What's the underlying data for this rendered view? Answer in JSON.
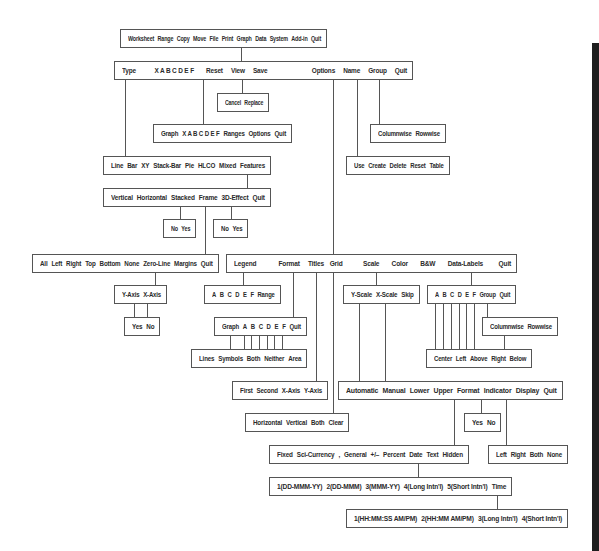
{
  "diagram": {
    "colors": {
      "line": "#555555",
      "text": "#2a2a2a",
      "background": "#ffffff",
      "edge_bar": "#1e1e1e"
    },
    "boxes": [
      {
        "id": "main_menu",
        "x": 120,
        "y": 29,
        "w": 207,
        "h": 19,
        "items": [
          "Worksheet",
          "Range",
          "Copy",
          "Move",
          "File",
          "Print",
          "Graph",
          "Data",
          "System",
          "Add-in",
          "Quit"
        ]
      },
      {
        "id": "graph_menu",
        "x": 114,
        "y": 61,
        "w": 299,
        "h": 19,
        "items": [
          "Type",
          "X A B C D E F",
          "Reset",
          "View",
          "Save",
          "Options",
          "Name",
          "Group",
          "Quit"
        ],
        "gaps": [
          0,
          18,
          10,
          5,
          5,
          50,
          5,
          5,
          5
        ]
      },
      {
        "id": "save_menu",
        "x": 217,
        "y": 93,
        "w": 52,
        "h": 19,
        "items": [
          "Cancel",
          "Replace"
        ]
      },
      {
        "id": "reset_menu",
        "x": 153,
        "y": 124,
        "w": 139,
        "h": 19,
        "items": [
          "Graph",
          "X A B C D E F",
          "Ranges",
          "Options",
          "Quit"
        ]
      },
      {
        "id": "group_menu",
        "x": 370,
        "y": 124,
        "w": 76,
        "h": 19,
        "items": [
          "Columnwise",
          "Rowwise"
        ]
      },
      {
        "id": "type_menu",
        "x": 103,
        "y": 156,
        "w": 168,
        "h": 19,
        "items": [
          "Line",
          "Bar",
          "XY",
          "Stack-Bar",
          "Pie",
          "HLCO",
          "Mixed",
          "Features"
        ]
      },
      {
        "id": "name_menu",
        "x": 346,
        "y": 156,
        "w": 104,
        "h": 19,
        "items": [
          "Use",
          "Create",
          "Delete",
          "Reset",
          "Table"
        ]
      },
      {
        "id": "features_menu",
        "x": 103,
        "y": 188,
        "w": 168,
        "h": 19,
        "items": [
          "Vertical",
          "Horizontal",
          "Stacked",
          "Frame",
          "3D-Effect",
          "Quit"
        ]
      },
      {
        "id": "stacked_yesno",
        "x": 163,
        "y": 219,
        "w": 33,
        "h": 19,
        "items": [
          "No",
          "Yes"
        ]
      },
      {
        "id": "effect_yesno",
        "x": 213,
        "y": 219,
        "w": 35,
        "h": 19,
        "items": [
          "No",
          "Yes"
        ]
      },
      {
        "id": "frame_menu",
        "x": 32,
        "y": 254,
        "w": 187,
        "h": 19,
        "items": [
          "All",
          "Left",
          "Right",
          "Top",
          "Bottom",
          "None",
          "Zero-Line",
          "Margins",
          "Quit"
        ]
      },
      {
        "id": "options_menu",
        "x": 226,
        "y": 254,
        "w": 291,
        "h": 19,
        "items": [
          "Legend",
          "Format",
          "Titles",
          "Grid",
          "Scale",
          "Color",
          "B&W",
          "Data-Labels",
          "Quit"
        ],
        "gaps": [
          0,
          22,
          5,
          2,
          20,
          10,
          10,
          10,
          14
        ]
      },
      {
        "id": "margins_axis",
        "x": 114,
        "y": 285,
        "w": 53,
        "h": 19,
        "items": [
          "Y-Axis",
          "X-Axis"
        ]
      },
      {
        "id": "legend_menu",
        "x": 204,
        "y": 285,
        "w": 77,
        "h": 19,
        "items": [
          "A",
          "B",
          "C",
          "D",
          "E",
          "F",
          "Range"
        ]
      },
      {
        "id": "scale_menu",
        "x": 343,
        "y": 285,
        "w": 77,
        "h": 19,
        "items": [
          "Y-Scale",
          "X-Scale",
          "Skip"
        ]
      },
      {
        "id": "datalabels_menu",
        "x": 427,
        "y": 285,
        "w": 89,
        "h": 19,
        "items": [
          "A",
          "B",
          "C",
          "D",
          "E",
          "F",
          "Group",
          "Quit"
        ]
      },
      {
        "id": "axis_yesno",
        "x": 124,
        "y": 317,
        "w": 36,
        "h": 19,
        "items": [
          "Yes",
          "No"
        ]
      },
      {
        "id": "format_menu",
        "x": 214,
        "y": 317,
        "w": 93,
        "h": 19,
        "items": [
          "Graph",
          "A",
          "B",
          "C",
          "D",
          "E",
          "F",
          "Quit"
        ]
      },
      {
        "id": "datalabels_group",
        "x": 482,
        "y": 317,
        "w": 76,
        "h": 19,
        "items": [
          "Columnwise",
          "Rowwise"
        ]
      },
      {
        "id": "format_style",
        "x": 191,
        "y": 349,
        "w": 116,
        "h": 19,
        "items": [
          "Lines",
          "Symbols",
          "Both",
          "Neither",
          "Area"
        ]
      },
      {
        "id": "label_position",
        "x": 426,
        "y": 349,
        "w": 106,
        "h": 19,
        "items": [
          "Center",
          "Left",
          "Above",
          "Right",
          "Below"
        ]
      },
      {
        "id": "titles_menu",
        "x": 232,
        "y": 381,
        "w": 96,
        "h": 19,
        "items": [
          "First",
          "Second",
          "X-Axis",
          "Y-Axis"
        ]
      },
      {
        "id": "scale_options",
        "x": 338,
        "y": 381,
        "w": 225,
        "h": 19,
        "items": [
          "Automatic",
          "Manual",
          "Lower",
          "Upper",
          "Format",
          "Indicator",
          "Display",
          "Quit"
        ]
      },
      {
        "id": "grid_menu",
        "x": 245,
        "y": 413,
        "w": 104,
        "h": 19,
        "items": [
          "Horizontal",
          "Vertical",
          "Both",
          "Clear"
        ]
      },
      {
        "id": "indicator_yesno",
        "x": 464,
        "y": 413,
        "w": 37,
        "h": 19,
        "items": [
          "Yes",
          "No"
        ]
      },
      {
        "id": "number_format",
        "x": 269,
        "y": 445,
        "w": 200,
        "h": 19,
        "items": [
          "Fixed",
          "Sci-Currency",
          ",",
          "General",
          "+/–",
          "Percent",
          "Date",
          "Text",
          "Hidden"
        ]
      },
      {
        "id": "display_menu",
        "x": 488,
        "y": 445,
        "w": 80,
        "h": 19,
        "items": [
          "Left",
          "Right",
          "Both",
          "None"
        ]
      },
      {
        "id": "date_format",
        "x": 269,
        "y": 477,
        "w": 243,
        "h": 19,
        "items": [
          "1(DD-MMM-YY)",
          "2(DD-MMM)",
          "3(MMM-YY)",
          "4(Long Intn'l)",
          "5(Short Intn'l)",
          "Time"
        ]
      },
      {
        "id": "time_format",
        "x": 346,
        "y": 509,
        "w": 222,
        "h": 19,
        "items": [
          "1(HH:MM:SS AM/PM)",
          "2(HH:MM AM/PM)",
          "3(Long Intn'l)",
          "4(Short Intn'l)"
        ]
      }
    ],
    "edges": [
      {
        "from": "main_menu",
        "item": "Graph",
        "to": "graph_menu",
        "points": [
          [
            241,
            48
          ],
          [
            241,
            61
          ]
        ]
      },
      {
        "from": "graph_menu",
        "item": "Type",
        "to": "type_menu",
        "points": [
          [
            125,
            80
          ],
          [
            125,
            156
          ]
        ]
      },
      {
        "from": "graph_menu",
        "item": "Reset",
        "to": "reset_menu",
        "points": [
          [
            203,
            80
          ],
          [
            203,
            124
          ]
        ]
      },
      {
        "from": "graph_menu",
        "item": "Save",
        "to": "save_menu",
        "points": [
          [
            242,
            80
          ],
          [
            242,
            93
          ]
        ]
      },
      {
        "from": "graph_menu",
        "item": "Options",
        "to": "options_menu",
        "points": [
          [
            333,
            80
          ],
          [
            333,
            254
          ]
        ]
      },
      {
        "from": "graph_menu",
        "item": "Name",
        "to": "name_menu",
        "points": [
          [
            357,
            80
          ],
          [
            357,
            156
          ]
        ]
      },
      {
        "from": "graph_menu",
        "item": "Group",
        "to": "group_menu",
        "points": [
          [
            379,
            80
          ],
          [
            379,
            124
          ]
        ]
      },
      {
        "from": "type_menu",
        "item": "Features",
        "to": "features_menu",
        "points": [
          [
            247,
            175
          ],
          [
            247,
            188
          ]
        ]
      },
      {
        "from": "features_menu",
        "item": "Vertical",
        "to": "stacked_yesno",
        "points": [
          [
            180,
            207
          ],
          [
            180,
            219
          ]
        ]
      },
      {
        "from": "features_menu",
        "item": "Frame",
        "to": "frame_menu",
        "points": [
          [
            205,
            207
          ],
          [
            205,
            254
          ]
        ]
      },
      {
        "from": "features_menu",
        "item": "3D-Effect",
        "to": "effect_yesno",
        "points": [
          [
            231,
            207
          ],
          [
            231,
            219
          ]
        ]
      },
      {
        "from": "frame_menu",
        "item": "Margins",
        "to": "margins_axis",
        "points": [
          [
            155,
            273
          ],
          [
            155,
            285
          ]
        ]
      },
      {
        "from": "margins_axis",
        "item": "Y-Axis",
        "to": "axis_yesno",
        "points": [
          [
            134,
            304
          ],
          [
            134,
            317
          ]
        ]
      },
      {
        "from": "margins_axis",
        "item": "X-Axis",
        "to": "axis_yesno",
        "points": [
          [
            147,
            304
          ],
          [
            147,
            317
          ]
        ]
      },
      {
        "from": "options_menu",
        "item": "Legend",
        "to": "legend_menu",
        "points": [
          [
            243,
            273
          ],
          [
            243,
            285
          ]
        ]
      },
      {
        "from": "options_menu",
        "item": "Format",
        "to": "format_menu",
        "points": [
          [
            293,
            273
          ],
          [
            293,
            317
          ]
        ]
      },
      {
        "from": "options_menu",
        "item": "Titles",
        "to": "titles_menu",
        "points": [
          [
            316,
            273
          ],
          [
            316,
            381
          ]
        ]
      },
      {
        "from": "options_menu",
        "item": "Grid",
        "to": "grid_menu",
        "points": [
          [
            333,
            273
          ],
          [
            333,
            413
          ]
        ]
      },
      {
        "from": "options_menu",
        "item": "Scale",
        "to": "scale_menu",
        "points": [
          [
            376,
            273
          ],
          [
            376,
            285
          ]
        ]
      },
      {
        "from": "options_menu",
        "item": "Data-Labels",
        "to": "datalabels_menu",
        "points": [
          [
            471,
            273
          ],
          [
            471,
            285
          ]
        ]
      },
      {
        "from": "scale_menu",
        "item": "Y-Scale",
        "to": "scale_options",
        "points": [
          [
            359,
            304
          ],
          [
            359,
            381
          ]
        ]
      },
      {
        "from": "scale_menu",
        "item": "X-Scale",
        "to": "scale_options",
        "points": [
          [
            385,
            304
          ],
          [
            385,
            381
          ]
        ]
      },
      {
        "from": "format_menu",
        "item": "Graph",
        "to": "format_style",
        "points": [
          [
            230,
            336
          ],
          [
            230,
            349
          ]
        ]
      },
      {
        "from": "format_menu",
        "items": [
          "A",
          "B",
          "C",
          "D",
          "E",
          "F"
        ],
        "to": "format_style",
        "xs": [
          244,
          251,
          259,
          267,
          274,
          282
        ],
        "y1": 336,
        "y2": 349
      },
      {
        "from": "datalabels_menu",
        "items": [
          "A",
          "B",
          "C",
          "D",
          "E",
          "F"
        ],
        "to": "label_position",
        "xs": [
          435,
          443,
          451,
          459,
          466,
          474
        ],
        "y1": 304,
        "y2": 349
      },
      {
        "from": "datalabels_menu",
        "item": "Group",
        "to": "datalabels_group",
        "points": [
          [
            487,
            304
          ],
          [
            487,
            317
          ]
        ]
      },
      {
        "from": "datalabels_group",
        "to": "label_position",
        "points": [
          [
            504,
            336
          ],
          [
            504,
            349
          ]
        ]
      },
      {
        "from": "scale_options",
        "item": "Format",
        "to": "number_format",
        "points": [
          [
            454,
            400
          ],
          [
            454,
            445
          ]
        ]
      },
      {
        "from": "scale_options",
        "item": "Indicator",
        "to": "indicator_yesno",
        "points": [
          [
            481,
            400
          ],
          [
            481,
            413
          ]
        ]
      },
      {
        "from": "scale_options",
        "item": "Display",
        "to": "display_menu",
        "points": [
          [
            506,
            400
          ],
          [
            506,
            445
          ]
        ]
      },
      {
        "from": "number_format",
        "item": "Date",
        "to": "date_format",
        "points": [
          [
            418,
            464
          ],
          [
            418,
            477
          ]
        ]
      },
      {
        "from": "date_format",
        "item": "Time",
        "to": "time_format",
        "points": [
          [
            497,
            496
          ],
          [
            497,
            509
          ]
        ]
      }
    ]
  }
}
